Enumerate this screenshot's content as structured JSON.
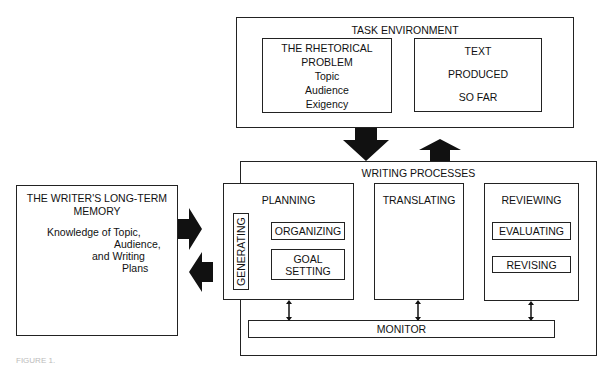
{
  "task_environment": {
    "title": "TASK ENVIRONMENT",
    "rhetorical_problem": {
      "title_line1": "THE RHETORICAL",
      "title_line2": "PROBLEM",
      "items": [
        "Topic",
        "Audience",
        "Exigency"
      ]
    },
    "text_produced": {
      "line1": "TEXT",
      "line2": "PRODUCED",
      "line3": "SO FAR"
    }
  },
  "writing_processes": {
    "title": "WRITING PROCESSES",
    "planning": {
      "title": "PLANNING",
      "generating": "GENERATING",
      "organizing": "ORGANIZING",
      "goal_setting_line1": "GOAL",
      "goal_setting_line2": "SETTING"
    },
    "translating": {
      "title": "TRANSLATING"
    },
    "reviewing": {
      "title": "REVIEWING",
      "evaluating": "EVALUATING",
      "revising": "REVISING"
    },
    "monitor": "MONITOR"
  },
  "long_term_memory": {
    "title_line1": "THE WRITER'S LONG-TERM",
    "title_line2": "MEMORY",
    "knowledge_lines": [
      "Knowledge of Topic,",
      "Audience,",
      "and Writing",
      "Plans"
    ]
  },
  "caption": "FIGURE 1."
}
